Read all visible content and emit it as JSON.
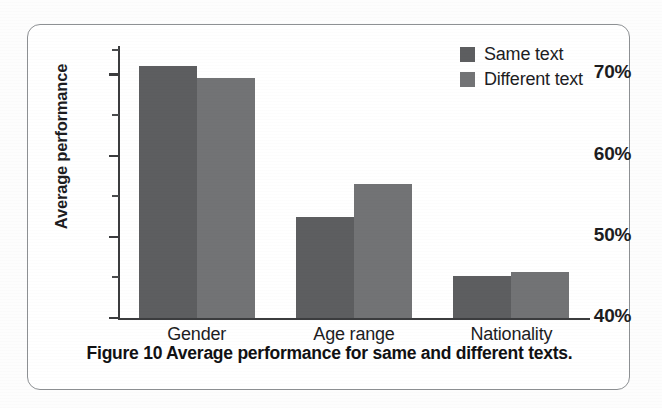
{
  "figure": {
    "caption": "Figure 10 Average performance for same and different texts."
  },
  "legend": {
    "position": "top-right",
    "items": [
      {
        "label": "Same text",
        "color": "#5d5e60"
      },
      {
        "label": "Different text",
        "color": "#727375"
      }
    ]
  },
  "axes": {
    "ylabel": "Average performance",
    "xlabel": "",
    "y_ticks": [
      "40%",
      "50%",
      "60%",
      "70%"
    ],
    "y_tick_values": [
      40,
      50,
      60,
      70
    ],
    "y_minor_tick_values": [
      45,
      55,
      65,
      73
    ],
    "x_ticks": [
      "Gender",
      "Age range",
      "Nationality"
    ]
  },
  "chart_data": {
    "type": "bar",
    "title": "",
    "subtitle": "",
    "categories": [
      "Gender",
      "Age range",
      "Nationality"
    ],
    "series": [
      {
        "name": "Same text",
        "color": "#5d5e60",
        "values": [
          71.0,
          52.4,
          45.2
        ]
      },
      {
        "name": "Different text",
        "color": "#727375",
        "values": [
          69.5,
          56.5,
          45.7
        ]
      }
    ],
    "xlabel": "",
    "ylabel": "Average performance",
    "ylim": [
      40,
      73.5
    ],
    "y_tick_labels": [
      "40%",
      "50%",
      "60%",
      "70%"
    ],
    "y_tick_values": [
      40,
      50,
      60,
      70
    ],
    "y_minor_tick_values": [
      45,
      55,
      65,
      73
    ],
    "y_unit": "%",
    "grid": false,
    "legend_position": "top-right",
    "bar_group_gap": true,
    "annotations": []
  }
}
